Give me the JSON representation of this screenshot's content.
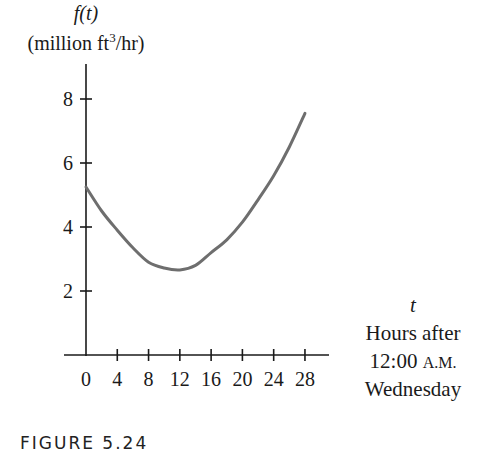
{
  "figure": {
    "caption": "FIGURE 5.24",
    "y_title_function": "f(t)",
    "y_title_units_pre": "(million ft",
    "y_title_units_sup": "3",
    "y_title_units_post": "/hr)",
    "x_title_var": "t",
    "x_title_line1": "Hours after",
    "x_title_line2_time": "12:00",
    "x_title_line2_ampm": "A.M.",
    "x_title_line3": "Wednesday",
    "colors": {
      "curve": "#6e6e6e",
      "axis": "#1a1a1a",
      "text": "#1a1a1a"
    }
  },
  "chart_data": {
    "type": "line",
    "title": "FIGURE 5.24",
    "xlabel": "t  Hours after 12:00 A.M. Wednesday",
    "ylabel": "f(t) (million ft^3/hr)",
    "x_ticks": [
      0,
      4,
      8,
      12,
      16,
      20,
      24,
      28
    ],
    "y_ticks": [
      2,
      4,
      6,
      8
    ],
    "xlim": [
      0,
      30
    ],
    "ylim": [
      0,
      9
    ],
    "grid": false,
    "legend": null,
    "series": [
      {
        "name": "f(t)",
        "x": [
          0,
          2,
          4,
          6,
          8,
          10,
          12,
          14,
          16,
          18,
          20,
          22,
          24,
          26,
          28
        ],
        "values": [
          5.25,
          4.5,
          3.9,
          3.35,
          2.9,
          2.72,
          2.66,
          2.8,
          3.2,
          3.6,
          4.15,
          4.85,
          5.6,
          6.5,
          7.55
        ]
      }
    ]
  }
}
